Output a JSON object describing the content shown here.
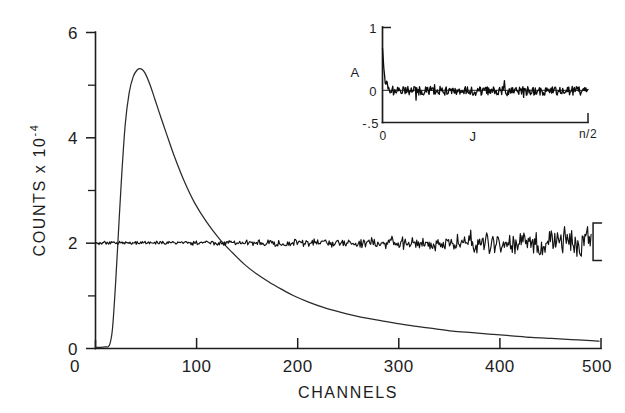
{
  "figure": {
    "background_color": "#ffffff",
    "ink_color": "#1d1d1d"
  },
  "main_axes": {
    "x_title": "CHANNELS",
    "y_title_base": "COUNTS x 10",
    "y_title_exponent": "-4",
    "x_ticks": [
      "0",
      "100",
      "200",
      "300",
      "400",
      "500"
    ],
    "y_ticks": [
      "0",
      "2",
      "4",
      "6"
    ],
    "origin_label": "0"
  },
  "inset_axes": {
    "y_title": "A",
    "x_title": "J",
    "y_tick_top": "1",
    "y_tick_mid": "0",
    "y_tick_bottom": "-.5",
    "x_tick_left": "0",
    "x_tick_right": "n/2"
  },
  "chart_data": {
    "type": "line",
    "title": "",
    "xlabel": "CHANNELS",
    "ylabel": "COUNTS x 10^-4",
    "xlim": [
      0,
      510
    ],
    "ylim": [
      0,
      6
    ],
    "xticks": [
      0,
      100,
      200,
      300,
      400,
      500
    ],
    "xticklabels": [
      "0",
      "100",
      "200",
      "300",
      "400",
      "500"
    ],
    "yticks": [
      0,
      1,
      2,
      3,
      4,
      5,
      6
    ],
    "yticklabels": [
      "0",
      "",
      "2",
      "",
      "4",
      "",
      "6"
    ],
    "grid": false,
    "legend": false,
    "series": [
      {
        "name": "counts spectrum",
        "type": "line",
        "x": [
          0,
          5,
          10,
          14,
          17,
          20,
          23,
          26,
          30,
          34,
          38,
          42,
          46,
          50,
          55,
          60,
          66,
          72,
          80,
          90,
          100,
          112,
          125,
          138,
          150,
          162,
          175,
          188,
          200,
          215,
          230,
          245,
          260,
          275,
          290,
          305,
          320,
          340,
          360,
          380,
          400,
          420,
          440,
          460,
          480,
          500,
          508
        ],
        "y": [
          0.02,
          0.02,
          0.03,
          0.06,
          0.35,
          1.15,
          2.15,
          3.15,
          4.25,
          4.85,
          5.15,
          5.28,
          5.3,
          5.22,
          5.0,
          4.72,
          4.38,
          4.05,
          3.62,
          3.15,
          2.76,
          2.4,
          2.08,
          1.82,
          1.6,
          1.42,
          1.26,
          1.12,
          1.0,
          0.88,
          0.78,
          0.7,
          0.63,
          0.57,
          0.52,
          0.47,
          0.43,
          0.38,
          0.33,
          0.3,
          0.27,
          0.24,
          0.21,
          0.19,
          0.17,
          0.15,
          0.14
        ]
      },
      {
        "name": "residual trace",
        "type": "noise-line",
        "baseline": 2.0,
        "x_start": 0,
        "x_end": 500,
        "amplitude_start": 0.035,
        "amplitude_end": 0.33,
        "description": "Noisy residual oscillating about counts = 2 with amplitude increasing toward high channel numbers"
      }
    ],
    "annotations": [
      {
        "name": "error-bracket",
        "x": 502,
        "y_low": 1.67,
        "y_high": 2.38,
        "description": "Vertical bracket marker at right edge of residual trace"
      }
    ],
    "inset": {
      "type": "line",
      "title": "",
      "xlabel": "J",
      "ylabel": "A",
      "xlim": [
        0,
        1
      ],
      "ylim": [
        -0.5,
        1
      ],
      "xticklabels": [
        "0",
        "n/2"
      ],
      "yticklabels": [
        "1",
        "0",
        "-.5"
      ],
      "grid": false,
      "legend": false,
      "series": [
        {
          "name": "autocorrelation",
          "baseline": 0.0,
          "initial_value": 0.62,
          "amplitude": 0.07,
          "description": "Autocorrelation coefficients A vs lag J, starting near 0.6 at J=0 and fluctuating about zero across the range"
        }
      ]
    }
  }
}
